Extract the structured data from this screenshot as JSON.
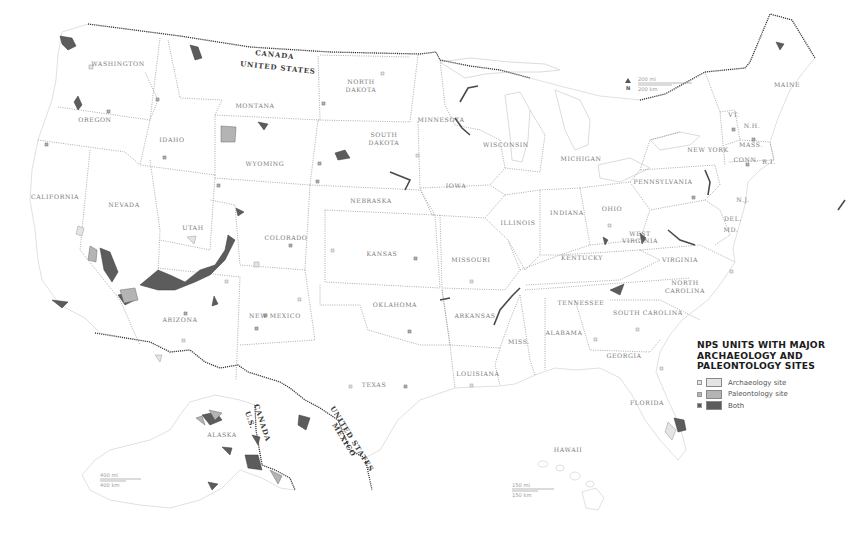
{
  "map": {
    "title": "NPS UNITS WITH MAJOR ARCHAEOLOGY AND PALEONTOLOGY SITES",
    "title_lines": [
      "NPS UNITS WITH MAJOR",
      "ARCHAEOLOGY AND",
      "PALEONTOLOGY SITES"
    ],
    "colors": {
      "archaeology": "#e4e4e4",
      "paleontology": "#b4b4b4",
      "both": "#5c5c5c",
      "state_border": "#8a8a8a",
      "intl_border": "#2e2e2e",
      "background": "#ffffff"
    }
  },
  "legend": {
    "items": [
      {
        "label": "Archaeology site",
        "category": "archaeology",
        "color": "#e4e4e4"
      },
      {
        "label": "Paleontology site",
        "category": "paleontology",
        "color": "#b4b4b4"
      },
      {
        "label": "Both",
        "category": "both",
        "color": "#5c5c5c"
      }
    ]
  },
  "border_labels": {
    "canada": "CANADA",
    "united_states": "UNITED STATES",
    "mexico": "MEXICO",
    "united_states_south": "UNITED STATES",
    "alaska_canada": "CANADA",
    "alaska_us": "U.S."
  },
  "states": [
    {
      "name": "WASHINGTON",
      "x": 97,
      "y": 66
    },
    {
      "name": "OREGON",
      "x": 95,
      "y": 122
    },
    {
      "name": "CALIFORNIA",
      "x": 55,
      "y": 199
    },
    {
      "name": "IDAHO",
      "x": 172,
      "y": 142
    },
    {
      "name": "NEVADA",
      "x": 124,
      "y": 207
    },
    {
      "name": "MONTANA",
      "x": 255,
      "y": 108
    },
    {
      "name": "WYOMING",
      "x": 265,
      "y": 166
    },
    {
      "name": "UTAH",
      "x": 193,
      "y": 230
    },
    {
      "name": "ARIZONA",
      "x": 180,
      "y": 322
    },
    {
      "name": "COLORADO",
      "x": 286,
      "y": 240
    },
    {
      "name": "NEW MEXICO",
      "x": 275,
      "y": 318
    },
    {
      "name": "NORTH",
      "x": 361,
      "y": 84
    },
    {
      "name": "DAKOTA",
      "x": 361,
      "y": 92
    },
    {
      "name": "SOUTH",
      "x": 384,
      "y": 137
    },
    {
      "name": "DAKOTA",
      "x": 384,
      "y": 145
    },
    {
      "name": "NEBRASKA",
      "x": 371,
      "y": 203
    },
    {
      "name": "KANSAS",
      "x": 382,
      "y": 256
    },
    {
      "name": "OKLAHOMA",
      "x": 395,
      "y": 307
    },
    {
      "name": "TEXAS",
      "x": 374,
      "y": 387
    },
    {
      "name": "MINNESOTA",
      "x": 441,
      "y": 122
    },
    {
      "name": "IOWA",
      "x": 456,
      "y": 188
    },
    {
      "name": "MISSOURI",
      "x": 471,
      "y": 262
    },
    {
      "name": "ARKANSAS",
      "x": 475,
      "y": 318
    },
    {
      "name": "LOUISIANA",
      "x": 478,
      "y": 376
    },
    {
      "name": "WISCONSIN",
      "x": 506,
      "y": 147
    },
    {
      "name": "ILLINOIS",
      "x": 518,
      "y": 225
    },
    {
      "name": "MISS.",
      "x": 519,
      "y": 344
    },
    {
      "name": "MICHIGAN",
      "x": 581,
      "y": 161
    },
    {
      "name": "INDIANA",
      "x": 567,
      "y": 215
    },
    {
      "name": "OHIO",
      "x": 612,
      "y": 211
    },
    {
      "name": "KENTUCKY",
      "x": 582,
      "y": 260
    },
    {
      "name": "TENNESSEE",
      "x": 581,
      "y": 305
    },
    {
      "name": "ALABAMA",
      "x": 564,
      "y": 335
    },
    {
      "name": "GEORGIA",
      "x": 624,
      "y": 358
    },
    {
      "name": "FLORIDA",
      "x": 647,
      "y": 405
    },
    {
      "name": "SOUTH CAROLINA",
      "x": 648,
      "y": 315
    },
    {
      "name": "NORTH",
      "x": 685,
      "y": 285
    },
    {
      "name": "CAROLINA",
      "x": 685,
      "y": 293
    },
    {
      "name": "VIRGINIA",
      "x": 680,
      "y": 262
    },
    {
      "name": "WEST",
      "x": 640,
      "y": 236
    },
    {
      "name": "VIRGINIA",
      "x": 640,
      "y": 243
    },
    {
      "name": "PENNSYLVANIA",
      "x": 663,
      "y": 184
    },
    {
      "name": "NEW YORK",
      "x": 708,
      "y": 152
    },
    {
      "name": "VT.",
      "x": 734,
      "y": 117
    },
    {
      "name": "N.H.",
      "x": 752,
      "y": 128
    },
    {
      "name": "MASS.",
      "x": 751,
      "y": 147
    },
    {
      "name": "CONN.",
      "x": 746,
      "y": 162
    },
    {
      "name": "R.I.",
      "x": 769,
      "y": 164
    },
    {
      "name": "N.J.",
      "x": 743,
      "y": 202
    },
    {
      "name": "DEL.",
      "x": 733,
      "y": 221
    },
    {
      "name": "MD.",
      "x": 731,
      "y": 232
    },
    {
      "name": "MAINE",
      "x": 787,
      "y": 87
    },
    {
      "name": "ALASKA",
      "x": 222,
      "y": 437
    },
    {
      "name": "HAWAII",
      "x": 568,
      "y": 452
    }
  ],
  "scale_bars": [
    {
      "id": "conus",
      "miles": "200 mi",
      "km": "200 km",
      "north": "N"
    },
    {
      "id": "alaska",
      "miles": "400 mi",
      "km": "400 km"
    },
    {
      "id": "hawaii",
      "miles": "150 mi",
      "km": "150 km"
    }
  ]
}
